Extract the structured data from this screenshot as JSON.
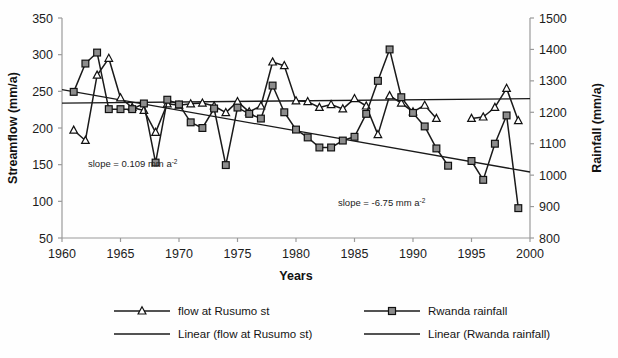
{
  "chart_data": {
    "type": "line",
    "title": "",
    "xlabel": "Years",
    "ylabel": "Streamflow (mm/a)",
    "y2label": "Rainfall (mm/a)",
    "xlim": [
      1960,
      2000
    ],
    "ylim": [
      50,
      350
    ],
    "y2lim": [
      800,
      1500
    ],
    "xticks": [
      1960,
      1965,
      1970,
      1975,
      1980,
      1985,
      1990,
      1995,
      2000
    ],
    "yticks": [
      50,
      100,
      150,
      200,
      250,
      300,
      350
    ],
    "y2ticks": [
      800,
      900,
      1000,
      1100,
      1200,
      1300,
      1400,
      1500
    ],
    "grid": false,
    "legend_position": "bottom",
    "x": [
      1961,
      1962,
      1963,
      1964,
      1965,
      1966,
      1967,
      1968,
      1969,
      1970,
      1971,
      1972,
      1973,
      1974,
      1975,
      1976,
      1977,
      1978,
      1979,
      1980,
      1981,
      1982,
      1983,
      1984,
      1985,
      1986,
      1987,
      1988,
      1989,
      1990,
      1991,
      1992,
      1993,
      1994,
      1995,
      1996,
      1997,
      1998,
      1999
    ],
    "series": [
      {
        "name": "flow at Rusumo st",
        "axis": "left",
        "marker": "triangle",
        "units": "mm/a",
        "values": [
          197,
          183,
          272,
          295,
          241,
          228,
          224,
          194,
          233,
          231,
          233,
          234,
          230,
          221,
          236,
          222,
          230,
          290,
          285,
          237,
          236,
          228,
          232,
          226,
          240,
          230,
          191,
          244,
          234,
          222,
          231,
          213,
          null,
          null,
          213,
          215,
          228,
          254,
          210
        ]
      },
      {
        "name": "Rwanda rainfall",
        "axis": "right",
        "marker": "square",
        "units": "mm/a",
        "values": [
          1265,
          1355,
          1390,
          1210,
          1210,
          1210,
          1228,
          1040,
          1240,
          1225,
          1168,
          1150,
          1212,
          1032,
          1215,
          1195,
          1180,
          1285,
          1200,
          1145,
          1120,
          1088,
          1088,
          1110,
          1122,
          1195,
          1300,
          1400,
          1248,
          1198,
          1155,
          1085,
          1030,
          null,
          1045,
          985,
          1100,
          1190,
          895
        ]
      }
    ],
    "trendlines": [
      {
        "name": "Linear (flow at Rusumo st)",
        "axis": "left",
        "slope_label": "slope  = 0.109 mm a",
        "slope_exponent": "-2",
        "y_start": 234,
        "y_end": 240
      },
      {
        "name": "Linear (Rwanda rainfall)",
        "axis": "right",
        "slope_label": "slope = -6.75 mm a",
        "slope_exponent": "-2",
        "y_start": 1272,
        "y_end": 1010
      }
    ],
    "annotations": [
      {
        "id": "flow-slope",
        "text": "slope  = 0.109 mm a",
        "sup": "-2",
        "x_px": 88,
        "y_px": 167
      },
      {
        "id": "rainfall-slope",
        "text": "slope = -6.75 mm a",
        "sup": "-2",
        "x_px": 338,
        "y_px": 206
      }
    ],
    "legend": [
      {
        "label": "flow at Rusumo st",
        "marker": "triangle",
        "line": true
      },
      {
        "label": "Rwanda rainfall",
        "marker": "square",
        "line": true
      },
      {
        "label": "Linear (flow at Rusumo st)",
        "marker": "none",
        "line": true
      },
      {
        "label": "Linear (Rwanda rainfall)",
        "marker": "none",
        "line": true
      }
    ],
    "colors": {
      "line": "#1a1a1a",
      "marker_fill": "#8c8c8c",
      "marker_stroke": "#111111",
      "axis": "#9a9a9a",
      "text": "#1a1a1a",
      "background": "#fefefe"
    }
  }
}
